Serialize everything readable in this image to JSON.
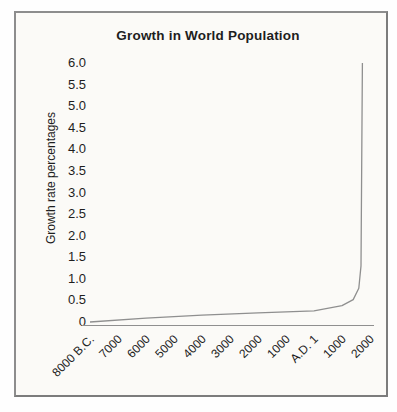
{
  "figure": {
    "page_background": "#fefefe",
    "panel_background": "#fbfaf7",
    "panel_border_color": "#8d8d8d"
  },
  "chart_data": {
    "type": "line",
    "title": "Growth in World Population",
    "xlabel": "",
    "ylabel": "Growth rate percentages",
    "ylim": [
      0,
      6
    ],
    "grid": false,
    "legend": false,
    "line_color": "#8f8f8f",
    "axis_color": "#8f8f8f",
    "categories": [
      "8000 B.C.",
      "7000",
      "6000",
      "5000",
      "4000",
      "3000",
      "2000",
      "1000",
      "A.D. 1",
      "1000",
      "2000"
    ],
    "y_tick_labels": [
      "0",
      "0.5",
      "1.0",
      "1.5",
      "2.0",
      "2.5",
      "3.0",
      "3.5",
      "4.0",
      "4.5",
      "5.0",
      "5.5",
      "6.0"
    ],
    "series": [
      {
        "points": [
          {
            "x_tick_index": 0.0,
            "value": 0.0
          },
          {
            "x_tick_index": 2.0,
            "value": 0.09
          },
          {
            "x_tick_index": 4.0,
            "value": 0.16
          },
          {
            "x_tick_index": 6.0,
            "value": 0.21
          },
          {
            "x_tick_index": 8.0,
            "value": 0.26
          },
          {
            "x_tick_index": 9.0,
            "value": 0.38
          },
          {
            "x_tick_index": 9.4,
            "value": 0.52
          },
          {
            "x_tick_index": 9.6,
            "value": 0.78
          },
          {
            "x_tick_index": 9.68,
            "value": 1.3
          },
          {
            "x_tick_index": 9.73,
            "value": 6.0
          }
        ]
      }
    ]
  }
}
